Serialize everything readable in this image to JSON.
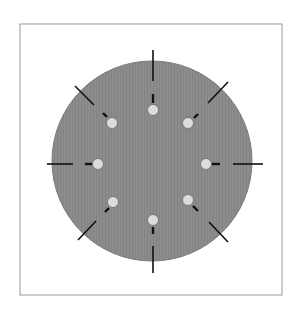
{
  "diagram": {
    "type": "circular-arrangement",
    "frame": {
      "x": 20,
      "y": 24,
      "width": 262,
      "height": 271,
      "stroke": "#aaaaaa"
    },
    "disc": {
      "cx": 152,
      "cy": 161,
      "r": 100,
      "fill": "#8c8c8c",
      "stroke": "#7a7a7a"
    },
    "dot_style": {
      "r": 5.5,
      "fill": "#dcdcdc",
      "stroke": "#6a6a6a"
    },
    "tick_color": "#111111",
    "spokes": [
      {
        "name": "top",
        "dot": [
          153,
          110
        ],
        "inner": [
          [
            153,
            94
          ],
          [
            153,
            103
          ]
        ],
        "outer": [
          [
            153,
            50
          ],
          [
            153,
            81
          ]
        ]
      },
      {
        "name": "top-right",
        "dot": [
          188,
          123
        ],
        "inner": [
          [
            194,
            118
          ],
          [
            198,
            114
          ]
        ],
        "outer": [
          [
            208,
            103
          ],
          [
            228,
            82
          ]
        ]
      },
      {
        "name": "right",
        "dot": [
          206,
          164
        ],
        "inner": [
          [
            210,
            164
          ],
          [
            220,
            164
          ]
        ],
        "outer": [
          [
            233,
            164
          ],
          [
            263,
            164
          ]
        ]
      },
      {
        "name": "bottom-right",
        "dot": [
          188,
          200
        ],
        "inner": [
          [
            193,
            206
          ],
          [
            198,
            211
          ]
        ],
        "outer": [
          [
            209,
            222
          ],
          [
            228,
            242
          ]
        ]
      },
      {
        "name": "bottom",
        "dot": [
          153,
          220
        ],
        "inner": [
          [
            153,
            227
          ],
          [
            153,
            234
          ]
        ],
        "outer": [
          [
            153,
            246
          ],
          [
            153,
            273
          ]
        ]
      },
      {
        "name": "bottom-left",
        "dot": [
          113,
          202
        ],
        "inner": [
          [
            109,
            208
          ],
          [
            105,
            212
          ]
        ],
        "outer": [
          [
            96,
            221
          ],
          [
            78,
            240
          ]
        ]
      },
      {
        "name": "left",
        "dot": [
          98,
          164
        ],
        "inner": [
          [
            92,
            164
          ],
          [
            85,
            164
          ]
        ],
        "outer": [
          [
            73,
            164
          ],
          [
            47,
            164
          ]
        ]
      },
      {
        "name": "top-left",
        "dot": [
          112,
          123
        ],
        "inner": [
          [
            107,
            117
          ],
          [
            103,
            113
          ]
        ],
        "outer": [
          [
            94,
            105
          ],
          [
            75,
            86
          ]
        ]
      }
    ]
  }
}
